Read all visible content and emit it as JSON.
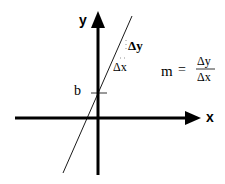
{
  "diagram": {
    "axes": {
      "x_label": "x",
      "y_label": "y"
    },
    "intercept_label": "b",
    "delta_y_label": "Δy",
    "delta_x_label": "Δx",
    "formula": {
      "lhs": "m",
      "equals": "=",
      "numerator": "Δy",
      "denominator": "Δx"
    },
    "colors": {
      "stroke": "#000000",
      "background": "#ffffff"
    }
  }
}
